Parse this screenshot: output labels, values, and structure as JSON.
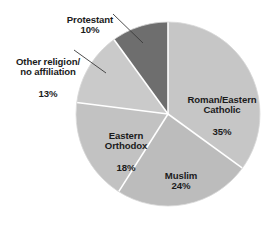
{
  "chart_data": {
    "type": "pie",
    "title": "",
    "subtitle": "",
    "legend_position": "none",
    "grid": false,
    "total": 100,
    "units": "percent",
    "categories": [
      "Roman/Eastern Catholic",
      "Muslim",
      "Eastern Orthodox",
      "Other religion/ no affiliation",
      "Protestant"
    ],
    "values": [
      35,
      24,
      18,
      13,
      10
    ],
    "slices": [
      {
        "id": "catholic",
        "name": "Roman/Eastern\nCatholic",
        "line1": "Roman/Eastern",
        "line2": "Catholic",
        "value": 35,
        "value_label": "35%",
        "color": "#c6c6c6",
        "start_angle_deg": 0,
        "end_angle_deg": 126,
        "label_placement": "inside"
      },
      {
        "id": "muslim",
        "name": "Muslim",
        "line1": "Muslim",
        "line2": "",
        "value": 24,
        "value_label": "24%",
        "color": "#bcbcbc",
        "start_angle_deg": 126,
        "end_angle_deg": 212.4,
        "label_placement": "inside"
      },
      {
        "id": "orthodox",
        "name": "Eastern\nOrthodox",
        "line1": "Eastern",
        "line2": "Orthodox",
        "value": 18,
        "value_label": "18%",
        "color": "#c2c2c2",
        "start_angle_deg": 212.4,
        "end_angle_deg": 277.2,
        "label_placement": "inside"
      },
      {
        "id": "other",
        "name": "Other religion/\nno affiliation",
        "line1": "Other religion/",
        "line2": "no affiliation",
        "value": 13,
        "value_label": "13%",
        "color": "#cacaca",
        "start_angle_deg": 277.2,
        "end_angle_deg": 324,
        "label_placement": "outside-leader"
      },
      {
        "id": "protestant",
        "name": "Protestant",
        "line1": "Protestant",
        "line2": "",
        "value": 10,
        "value_label": "10%",
        "color": "#6e6e6e",
        "start_angle_deg": 324,
        "end_angle_deg": 360,
        "label_placement": "outside-leader"
      }
    ],
    "style": {
      "background": "#ffffff",
      "separator_color": "#ffffff",
      "outline_color": "#d8d8d8",
      "text_color": "#1b1b1b",
      "leader_line_color": "#3a3a3a"
    },
    "geometry": {
      "center_x": 168,
      "center_y": 114,
      "radius": 92
    }
  }
}
